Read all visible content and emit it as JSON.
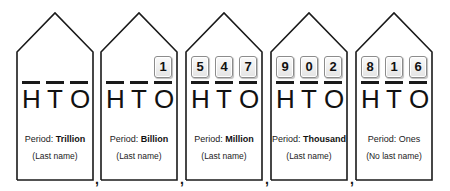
{
  "periods": [
    {
      "name": "Trillion",
      "period_label": "Period:",
      "name_bold": true,
      "last_name_note": "(Last name)",
      "places": [
        "H",
        "T",
        "O"
      ],
      "digits": [
        "",
        "",
        ""
      ]
    },
    {
      "name": "Billion",
      "period_label": "Period:",
      "name_bold": true,
      "last_name_note": "(Last name)",
      "places": [
        "H",
        "T",
        "O"
      ],
      "digits": [
        "",
        "",
        "1"
      ]
    },
    {
      "name": "Million",
      "period_label": "Period:",
      "name_bold": true,
      "last_name_note": "(Last name)",
      "places": [
        "H",
        "T",
        "O"
      ],
      "digits": [
        "5",
        "4",
        "7"
      ]
    },
    {
      "name": "Thousand",
      "period_label": "Period:",
      "name_bold": true,
      "last_name_note": "(Last name)",
      "places": [
        "H",
        "T",
        "O"
      ],
      "digits": [
        "9",
        "0",
        "2"
      ]
    },
    {
      "name": "Ones",
      "period_label": "Period:",
      "name_bold": false,
      "last_name_note": "(No last name)",
      "places": [
        "H",
        "T",
        "O"
      ],
      "digits": [
        "8",
        "1",
        "6"
      ]
    }
  ],
  "separator": ",",
  "number_shown": "1,547,902,816",
  "colors": {
    "outline": "#1a1a1a",
    "tile_border": "#8c8c8c",
    "tile_fill": "#f0f0f0"
  }
}
